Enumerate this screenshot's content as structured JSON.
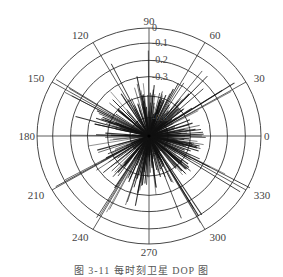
{
  "chart_data": {
    "type": "polar",
    "title": "",
    "caption": "图 3-11  每时刻卫星 DOP 图",
    "angle_ticks": [
      0,
      30,
      60,
      90,
      120,
      150,
      180,
      210,
      240,
      270,
      300,
      330
    ],
    "angle_tick_labels": [
      "0",
      "30",
      "60",
      "90",
      "120",
      "150",
      "180",
      "210",
      "240",
      "270",
      "300",
      "330"
    ],
    "radial_tick_labels": [
      "0",
      "0.1",
      "0.2",
      "0.3",
      "0.6"
    ],
    "radial_rings": [
      {
        "label": "0",
        "r_frac": 1.0
      },
      {
        "label": "0.1",
        "r_frac": 0.86
      },
      {
        "label": "0.2",
        "r_frac": 0.7
      },
      {
        "label": "0.3",
        "r_frac": 0.55
      },
      {
        "label": "",
        "r_frac": 0.37
      },
      {
        "label": "0.6",
        "r_frac": 0.17
      }
    ],
    "radial_axis_direction": "reversed (0 at outer ring, increasing toward center)",
    "grid": true,
    "series": [
      {
        "name": "spokes",
        "description": "Dense set of radial line segments from the center with varying lengths at many azimuths; longest spokes reach the outer ring near 30°, 150°, 210°, 300°, 330°; most cluster between 0.2 and 0.4 of the radius.",
        "count_estimate": 360
      }
    ]
  },
  "colors": {
    "grid": "#333333",
    "spoke": "#111111",
    "text": "#444444",
    "background": "#ffffff"
  }
}
